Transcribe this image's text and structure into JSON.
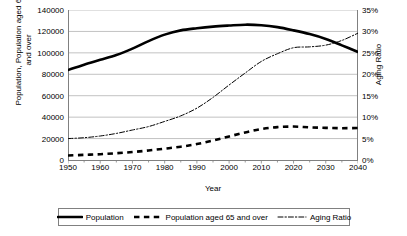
{
  "chart_data": {
    "type": "line",
    "title": "",
    "xlabel": "Year",
    "ylabel": "Population, Population aged 65\nand over",
    "y2label": "Aging Ratio",
    "xlim": [
      1950,
      2040
    ],
    "ylim": [
      0,
      140000
    ],
    "y2lim": [
      0,
      0.35
    ],
    "grid": true,
    "legend_position": "bottom",
    "x_major_ticks": [
      1950,
      1960,
      1970,
      1980,
      1990,
      2000,
      2010,
      2020,
      2030,
      2040
    ],
    "x_minor_tick_step": 5,
    "x_tick_labels": [
      "1950",
      "1960",
      "1970",
      "1980",
      "1990",
      "2000",
      "2010",
      "2020",
      "2030",
      "2040"
    ],
    "y_ticks": [
      0,
      20000,
      40000,
      60000,
      80000,
      100000,
      120000,
      140000
    ],
    "y_tick_labels": [
      "0",
      "20000",
      "40000",
      "60000",
      "80000",
      "100000",
      "120000",
      "140000"
    ],
    "y2_ticks": [
      0,
      0.05,
      0.1,
      0.15,
      0.2,
      0.25,
      0.3,
      0.35
    ],
    "y2_tick_labels": [
      "0%",
      "5%",
      "10%",
      "15%",
      "20%",
      "25%",
      "30%",
      "35%"
    ],
    "x": [
      1950,
      1955,
      1960,
      1965,
      1970,
      1975,
      1980,
      1985,
      1990,
      1995,
      2000,
      2005,
      2010,
      2015,
      2020,
      2025,
      2030,
      2035,
      2040
    ],
    "series": [
      {
        "name": "Population",
        "axis": "left",
        "style": "solid",
        "color": "#000000",
        "width": 2.6,
        "values": [
          84000,
          89000,
          93500,
          98000,
          104000,
          111000,
          117000,
          121000,
          123000,
          124500,
          125500,
          126300,
          125800,
          124000,
          121000,
          117500,
          113000,
          107000,
          100800
        ]
      },
      {
        "name": "Population aged 65 and over",
        "axis": "left",
        "style": "dashed",
        "color": "#000000",
        "width": 2.6,
        "values": [
          4200,
          4800,
          5400,
          6300,
          7400,
          8900,
          10600,
          12400,
          14900,
          18200,
          22000,
          25700,
          28900,
          30700,
          31200,
          30500,
          30000,
          29700,
          29800
        ]
      },
      {
        "name": "Aging Ratio",
        "axis": "right",
        "style": "dashdot",
        "color": "#000000",
        "width": 1,
        "values": [
          0.05,
          0.052,
          0.056,
          0.062,
          0.07,
          0.078,
          0.09,
          0.103,
          0.121,
          0.146,
          0.175,
          0.203,
          0.23,
          0.248,
          0.262,
          0.264,
          0.268,
          0.279,
          0.296
        ]
      }
    ],
    "legend_entries": [
      {
        "label": "Population",
        "style": "solid"
      },
      {
        "label": "Population aged 65 and over",
        "style": "dashed"
      },
      {
        "label": "Aging Ratio",
        "style": "dashdot"
      }
    ]
  }
}
